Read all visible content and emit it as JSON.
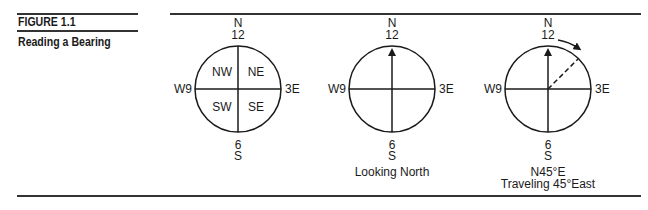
{
  "figure": {
    "number_label": "FIGURE 1.1",
    "title": "Reading a Bearing"
  },
  "compasses": [
    {
      "north_letter": "N",
      "north_number": "12",
      "south_number": "6",
      "south_letter": "S",
      "west_label": "W9",
      "east_label": "3E",
      "quadrants": {
        "nw": "NW",
        "ne": "NE",
        "sw": "SW",
        "se": "SE"
      },
      "caption_line1": "",
      "caption_line2": ""
    },
    {
      "north_letter": "N",
      "north_number": "12",
      "south_number": "6",
      "south_letter": "S",
      "west_label": "W9",
      "east_label": "3E",
      "caption_line1": "Looking North",
      "caption_line2": ""
    },
    {
      "north_letter": "N",
      "north_number": "12",
      "south_number": "6",
      "south_letter": "S",
      "west_label": "W9",
      "east_label": "3E",
      "caption_line1": "N45°E",
      "caption_line2": "Traveling 45°East",
      "bearing_degrees": 45
    }
  ],
  "colors": {
    "ink": "#1a1a1a",
    "rule": "#333333",
    "background": "#ffffff"
  }
}
